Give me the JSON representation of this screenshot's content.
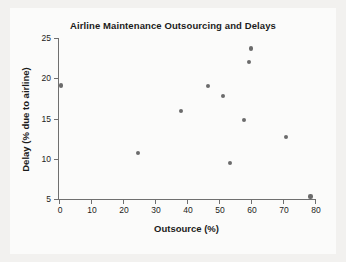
{
  "chart_data": {
    "type": "scatter",
    "title": "Airline Maintenance Outsourcing and Delays",
    "xlabel": "Outsource (%)",
    "ylabel": "Delay (% due to airline)",
    "xlim": [
      0,
      80
    ],
    "ylim": [
      5,
      25
    ],
    "xticks": [
      0,
      10,
      20,
      30,
      40,
      50,
      60,
      70,
      80
    ],
    "yticks": [
      5,
      10,
      15,
      20,
      25
    ],
    "xtick_labels": [
      "0",
      "10",
      "20",
      "30",
      "40",
      "50",
      "60",
      "70",
      "80"
    ],
    "ytick_labels": [
      "5",
      "10",
      "15",
      "20",
      "25"
    ],
    "grid": false,
    "legend": null,
    "marker_color": "#6b6b6b",
    "axis_color": "#6f6f6f",
    "background_color": "#f2f1ef",
    "plot_background_color": "#fbfbfa",
    "points": [
      {
        "x": 0.5,
        "y": 19.1
      },
      {
        "x": 24.8,
        "y": 10.7
      },
      {
        "x": 38.0,
        "y": 15.9
      },
      {
        "x": 46.6,
        "y": 19.0
      },
      {
        "x": 51.3,
        "y": 17.8
      },
      {
        "x": 53.4,
        "y": 9.5
      },
      {
        "x": 57.9,
        "y": 14.8
      },
      {
        "x": 59.4,
        "y": 22.0
      },
      {
        "x": 60.0,
        "y": 23.7
      },
      {
        "x": 71.0,
        "y": 12.7
      },
      {
        "x": 78.6,
        "y": 5.3
      }
    ]
  }
}
